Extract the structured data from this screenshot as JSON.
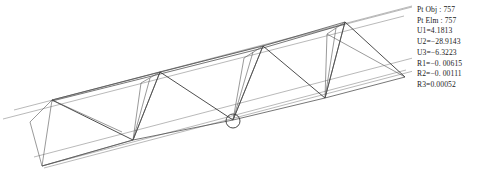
{
  "window": {
    "title": "Space Truss Result View",
    "background_color": "#ffffff"
  },
  "results": {
    "label": "selection-results",
    "lines": [
      "Pt Obj : 757",
      "Pt Elm : 757",
      "U1=4.1813",
      "U2=−28.9143",
      "U3=−6.3223",
      "R1=−0. 00615",
      "R2=−0. 00111",
      "R3=0.00052"
    ],
    "fields": [
      {
        "name": "Pt Obj",
        "value": "757"
      },
      {
        "name": "Pt Elm",
        "value": "757"
      },
      {
        "name": "U1",
        "value": "4.1813"
      },
      {
        "name": "U2",
        "value": "−28.9143"
      },
      {
        "name": "U3",
        "value": "−6.3223"
      },
      {
        "name": "R1",
        "value": "−0. 00615"
      },
      {
        "name": "R2",
        "value": "−0. 00111"
      },
      {
        "name": "R3",
        "value": "0.00052"
      }
    ],
    "text_color": "#1a1a1a"
  },
  "model": {
    "name": "deformed-space-truss",
    "description": "Triangular space truss shown in perspective with zig-zag web members",
    "colors": {
      "guide": "#8a8a8a",
      "chord": "#4a4a4a",
      "web": "#2e2e2e",
      "node_marker": "#333333"
    },
    "selected_node": {
      "x": 233,
      "y": 120,
      "radius": 7
    },
    "guide_lines": [
      {
        "name": "upper-guide",
        "x1": 14,
        "y1": 110,
        "x2": 412,
        "y2": 7
      },
      {
        "name": "mid-guide",
        "x1": 5,
        "y1": 119,
        "x2": 405,
        "y2": 17
      },
      {
        "name": "lower-guide",
        "x1": 34,
        "y1": 156,
        "x2": 430,
        "y2": 52
      }
    ],
    "top_chord": [
      {
        "x": 52,
        "y": 100
      },
      {
        "x": 160,
        "y": 72
      },
      {
        "x": 263,
        "y": 46
      },
      {
        "x": 345,
        "y": 22
      }
    ],
    "bottom_chord": [
      {
        "x": 42,
        "y": 166
      },
      {
        "x": 133,
        "y": 140
      },
      {
        "x": 233,
        "y": 120
      },
      {
        "x": 325,
        "y": 98
      },
      {
        "x": 405,
        "y": 77
      }
    ],
    "zigzag": [
      {
        "x": 52,
        "y": 100
      },
      {
        "x": 133,
        "y": 140
      },
      {
        "x": 160,
        "y": 72
      },
      {
        "x": 233,
        "y": 120
      },
      {
        "x": 263,
        "y": 46
      },
      {
        "x": 325,
        "y": 98
      },
      {
        "x": 345,
        "y": 22
      },
      {
        "x": 405,
        "y": 77
      }
    ]
  }
}
